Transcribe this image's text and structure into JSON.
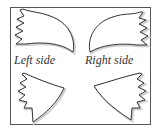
{
  "labels": {
    "left": "Left side",
    "right": "Right side"
  },
  "colors": {
    "outline": "#333333",
    "frame": "#555555",
    "shadow": "#cccccc"
  },
  "shapes": [
    {
      "name": "upper-left-wing"
    },
    {
      "name": "upper-right-wing"
    },
    {
      "name": "lower-left-wing"
    },
    {
      "name": "lower-right-wing"
    }
  ]
}
